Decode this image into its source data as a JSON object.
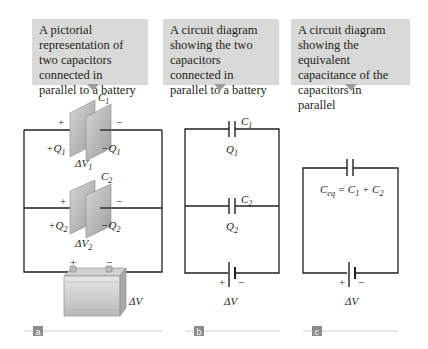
{
  "captions": {
    "a": "A pictorial representation of two capacitors connected in parallel to a battery",
    "b": "A circuit diagram showing the two capacitors connected in parallel to a battery",
    "c": "A circuit diagram showing the equivalent capacitance of the capacitors in parallel"
  },
  "panel_a": {
    "c1_label": "C",
    "c1_sub": "1",
    "c2_label": "C",
    "c2_sub": "2",
    "plus": "+",
    "minus": "−",
    "plus_q1": "+Q",
    "plus_q1_sub": "1",
    "minus_q1": "−Q",
    "minus_q1_sub": "1",
    "dv1": "ΔV",
    "dv1_sub": "1",
    "plus_q2": "+Q",
    "plus_q2_sub": "2",
    "minus_q2": "−Q",
    "minus_q2_sub": "2",
    "dv2": "ΔV",
    "dv2_sub": "2",
    "battery_dv": "ΔV",
    "badge": "a"
  },
  "panel_b": {
    "c1_label": "C",
    "c1_sub": "1",
    "q1_label": "Q",
    "q1_sub": "1",
    "c2_label": "C",
    "c2_sub": "2",
    "q2_label": "Q",
    "q2_sub": "2",
    "plus": "+",
    "minus": "−",
    "battery_dv": "ΔV",
    "badge": "b"
  },
  "panel_c": {
    "ceq_label": "C",
    "ceq_sub": "eq",
    "equation_rest": " = C",
    "eq_sub1": "1",
    "eq_plus": " + C",
    "eq_sub2": "2",
    "plus": "+",
    "minus": "−",
    "battery_dv": "ΔV",
    "badge": "c"
  },
  "colors": {
    "caption_bg": "#d9d9d8",
    "caption_arrow": "#9c9c9c",
    "wire": "#231f20",
    "plate": "#bdbdbd",
    "badge_bg": "#8c8c8c",
    "rule": "#d0d0d0"
  }
}
